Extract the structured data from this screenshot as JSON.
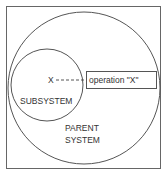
{
  "diagram": {
    "parent_label_line1": "PARENT",
    "parent_label_line2": "SYSTEM",
    "subsystem_label": "SUBSYSTEM",
    "x_marker": "X",
    "operation_label": "operation \"X\"",
    "colors": {
      "stroke": "#555555",
      "text": "#333333",
      "background": "#ffffff"
    }
  }
}
